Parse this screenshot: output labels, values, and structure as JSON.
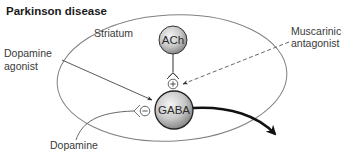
{
  "diagram": {
    "title": "Parkinson disease",
    "region_label": "Striatum",
    "neurons": [
      {
        "id": "ach",
        "label": "ACh"
      },
      {
        "id": "gaba",
        "label": "GABA"
      }
    ],
    "drugs": {
      "dopamine_agonist": {
        "line1": "Dopamine",
        "line2": "agonist"
      },
      "muscarinic_antagonist": {
        "line1": "Muscarinic",
        "line2": "antagonist"
      },
      "dopamine": {
        "label": "Dopamine"
      }
    },
    "receptor_signs": {
      "ach_on_gaba": "+",
      "dopamine_on_gaba": "−"
    },
    "colors": {
      "outline": "#7a7a7a",
      "arrow": "#1a1a1a",
      "neuron_light": "#f2f2f2",
      "neuron_dark": "#8a8a8a"
    }
  }
}
